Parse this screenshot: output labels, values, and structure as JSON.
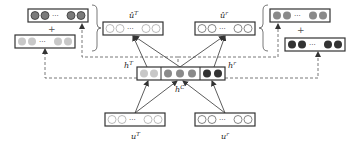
{
  "diagram": {
    "type": "neural-architecture",
    "colors": {
      "box_border": "#333333",
      "empty_node": "#ffffff",
      "light_node": "#c8c8c8",
      "mid_node": "#8a8a8a",
      "gray_node": "#7a7a7a",
      "dark_node": "#333333",
      "dashed_line": "#555555",
      "arrow": "#333333"
    },
    "labels": {
      "u_hat_T": "û",
      "u_hat_T_sup": "T",
      "u_hat_r": "û",
      "u_hat_r_sup": "r",
      "h_T": "h",
      "h_T_sup": "T",
      "h_r": "h",
      "h_r_sup": "r",
      "h_C": "h",
      "h_C_sup": "C",
      "u_T": "u",
      "u_T_sup": "T",
      "u_r": "u",
      "u_r_sup": "r",
      "plus_left": "+",
      "plus_right": "+",
      "ellipsis": "···"
    },
    "nodes": [
      {
        "id": "top-left-gray-vector",
        "fill": "gray",
        "count_shown": 4
      },
      {
        "id": "left-light-vector",
        "fill": "light",
        "count_shown": 4
      },
      {
        "id": "u-hat-T-vector",
        "fill": "empty",
        "count_shown": 4
      },
      {
        "id": "u-hat-r-vector",
        "fill": "empty",
        "count_shown": 4
      },
      {
        "id": "top-right-gray-vector",
        "fill": "gray",
        "count_shown": 4
      },
      {
        "id": "right-dark-vector",
        "fill": "dark",
        "count_shown": 4
      },
      {
        "id": "h-shared-vector",
        "segments": [
          "h^T (light, 2)",
          "h^C (mid, 3)",
          "h^r (dark, 2)"
        ]
      },
      {
        "id": "u-T-input-vector",
        "fill": "empty",
        "count_shown": 4
      },
      {
        "id": "u-r-input-vector",
        "fill": "empty",
        "count_shown": 4
      }
    ]
  }
}
